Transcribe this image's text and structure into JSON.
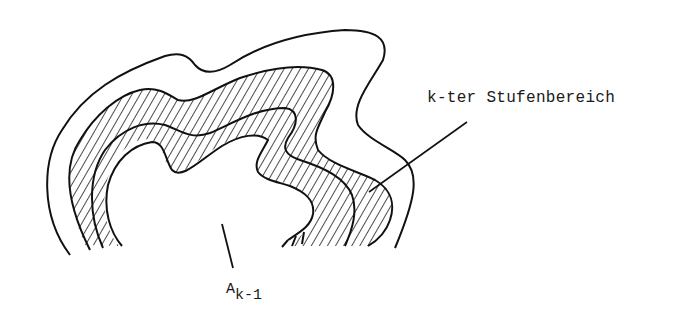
{
  "diagram": {
    "labels": {
      "stufenbereich": "k-ter Stufenbereich",
      "a_main": "A",
      "a_subscript": "k-1"
    },
    "colors": {
      "stroke": "#111111",
      "background": "#ffffff"
    }
  }
}
